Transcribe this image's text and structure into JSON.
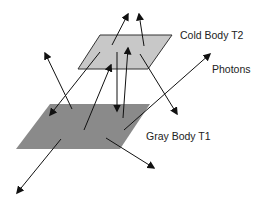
{
  "diagram": {
    "labels": {
      "cold_body": "Cold Body T2",
      "photons": "Photons",
      "gray_body": "Gray Body T1"
    },
    "colors": {
      "cold_body_fill": "#c8c8c8",
      "cold_body_stroke": "#333333",
      "gray_body_fill": "#8a8a8a",
      "arrow": "#111111",
      "text": "#222222"
    },
    "shapes": {
      "cold_body": [
        [
          100,
          35
        ],
        [
          172,
          35
        ],
        [
          148,
          69
        ],
        [
          78,
          69
        ]
      ],
      "gray_body": [
        [
          50,
          104
        ],
        [
          150,
          104
        ],
        [
          120,
          149
        ],
        [
          16,
          149
        ]
      ]
    },
    "arrows": [
      {
        "from": [
          112,
          45
        ],
        "to": [
          128,
          14
        ]
      },
      {
        "from": [
          144,
          46
        ],
        "to": [
          139,
          14
        ]
      },
      {
        "from": [
          100,
          52
        ],
        "to": [
          50,
          115
        ]
      },
      {
        "from": [
          72,
          109
        ],
        "to": [
          45,
          53
        ]
      },
      {
        "from": [
          84,
          130
        ],
        "to": [
          111,
          65
        ]
      },
      {
        "from": [
          117,
          52
        ],
        "to": [
          117,
          111
        ]
      },
      {
        "from": [
          123,
          118
        ],
        "to": [
          128,
          48
        ]
      },
      {
        "from": [
          140,
          54
        ],
        "to": [
          177,
          114
        ]
      },
      {
        "from": [
          124,
          130
        ],
        "to": [
          210,
          54
        ]
      },
      {
        "from": [
          106,
          138
        ],
        "to": [
          154,
          168
        ]
      },
      {
        "from": [
          61,
          139
        ],
        "to": [
          17,
          193
        ]
      }
    ]
  }
}
